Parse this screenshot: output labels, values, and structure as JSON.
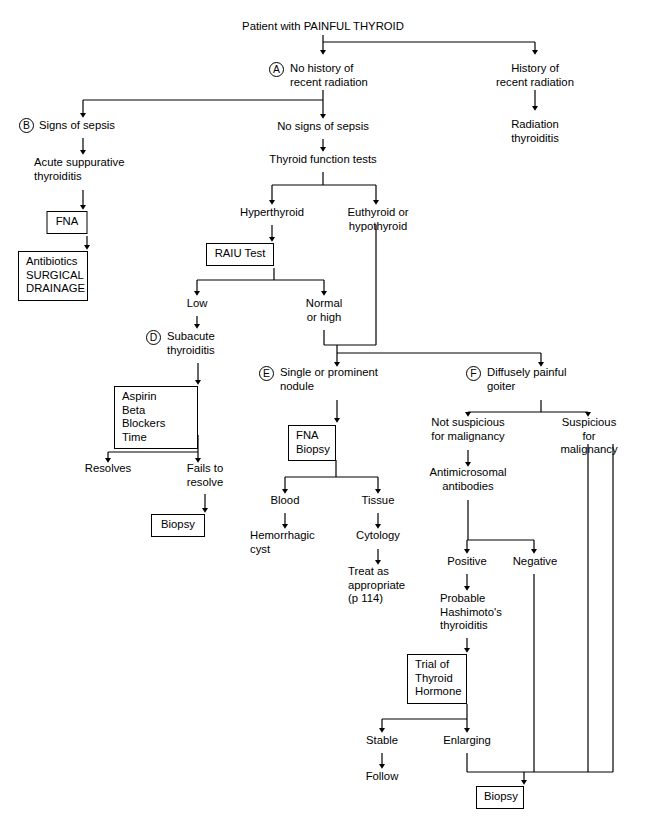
{
  "diagram": {
    "title": "Patient with PAINFUL THYROID",
    "type": "clinical-decision-flowchart"
  },
  "tags": [
    {
      "letter": "A",
      "x": 269,
      "y": 62
    },
    {
      "letter": "B",
      "x": 19,
      "y": 125
    },
    {
      "letter": "C",
      "x": 222,
      "y": 249
    },
    {
      "letter": "D",
      "x": 146,
      "y": 336
    },
    {
      "letter": "E",
      "x": 259,
      "y": 372
    },
    {
      "letter": "F",
      "x": 466,
      "y": 372
    }
  ],
  "nodes": [
    {
      "id": "root",
      "text": "Patient with PAINFUL THYROID",
      "x": 323,
      "y": 22,
      "box": false
    },
    {
      "id": "no-hx-rad",
      "text": "No history of\nrecent radiation",
      "x": 328,
      "y": 62,
      "box": false
    },
    {
      "id": "hx-rad",
      "text": "History of\nrecent radiation",
      "x": 535,
      "y": 62,
      "box": false
    },
    {
      "id": "rad-thyroiditis",
      "text": "Radiation\nthyroiditis",
      "x": 535,
      "y": 118,
      "box": false
    },
    {
      "id": "signs-sepsis",
      "text": "Signs of sepsis",
      "x": 83,
      "y": 125,
      "box": false
    },
    {
      "id": "acute-supp",
      "text": "Acute suppurative\nthyroiditis",
      "x": 83,
      "y": 162,
      "box": false
    },
    {
      "id": "fna-1",
      "text": "FNA",
      "x": 87,
      "y": 213,
      "box": true,
      "w": 41,
      "h": 23
    },
    {
      "id": "abx-surg",
      "text": "Antibiotics\nSURGICAL\nDRAINAGE",
      "x": 87,
      "y": 253,
      "box": true,
      "w": 70,
      "h": 48
    },
    {
      "id": "no-signs-sepsis",
      "text": "No signs of sepsis",
      "x": 323,
      "y": 126,
      "box": false
    },
    {
      "id": "tft",
      "text": "Thyroid function tests",
      "x": 323,
      "y": 159,
      "box": false
    },
    {
      "id": "hyperthyroid",
      "text": "Hyperthyroid",
      "x": 272,
      "y": 212,
      "box": false
    },
    {
      "id": "eu-hypo",
      "text": "Euthyroid or\nhypothyroid",
      "x": 376,
      "y": 212,
      "box": false
    },
    {
      "id": "raiu",
      "text": "RAIU Test",
      "x": 274,
      "y": 245,
      "box": true,
      "w": 68,
      "h": 23
    },
    {
      "id": "low",
      "text": "Low",
      "x": 197,
      "y": 303,
      "box": false
    },
    {
      "id": "normal-high",
      "text": "Normal\nor high",
      "x": 324,
      "y": 303,
      "box": false
    },
    {
      "id": "subacute",
      "text": "Subacute\nthyroiditis",
      "x": 197,
      "y": 336,
      "box": false
    },
    {
      "id": "aspirin",
      "text": "Aspirin\nBeta Blockers\nTime",
      "x": 156,
      "y": 388,
      "box": true,
      "w": 84,
      "h": 47
    },
    {
      "id": "resolves",
      "text": "Resolves",
      "x": 108,
      "y": 468,
      "box": false
    },
    {
      "id": "fails-resolve",
      "text": "Fails to\nresolve",
      "x": 198,
      "y": 468,
      "box": false
    },
    {
      "id": "biopsy-1",
      "text": "Biopsy",
      "x": 178,
      "y": 516,
      "box": true,
      "w": 54,
      "h": 23
    },
    {
      "id": "single-nodule",
      "text": "Single or prominent\nnodule",
      "x": 337,
      "y": 372,
      "box": false
    },
    {
      "id": "fna-biopsy",
      "text": "FNA\nBiopsy",
      "x": 312,
      "y": 427,
      "box": true,
      "w": 48,
      "h": 33
    },
    {
      "id": "blood",
      "text": "Blood",
      "x": 285,
      "y": 500,
      "box": false
    },
    {
      "id": "tissue",
      "text": "Tissue",
      "x": 378,
      "y": 500,
      "box": false
    },
    {
      "id": "hem-cyst",
      "text": "Hemorrhagic\ncyst",
      "x": 285,
      "y": 535,
      "box": false
    },
    {
      "id": "cytology",
      "text": "Cytology",
      "x": 378,
      "y": 535,
      "box": false
    },
    {
      "id": "treat-approp",
      "text": "Treat as\nappropriate\n(p 114)",
      "x": 378,
      "y": 570,
      "box": false
    },
    {
      "id": "diffuse-goiter",
      "text": "Diffusely painful\ngoiter",
      "x": 541,
      "y": 372,
      "box": false
    },
    {
      "id": "not-susp",
      "text": "Not suspicious\nfor malignancy",
      "x": 468,
      "y": 422,
      "box": false
    },
    {
      "id": "susp",
      "text": "Suspicious for\nmalignancy",
      "x": 588,
      "y": 422,
      "box": false
    },
    {
      "id": "antimicrosomal",
      "text": "Antimicrosomal\nantibodies",
      "x": 468,
      "y": 472,
      "box": false
    },
    {
      "id": "positive",
      "text": "Positive",
      "x": 467,
      "y": 561,
      "box": false
    },
    {
      "id": "negative",
      "text": "Negative",
      "x": 534,
      "y": 561,
      "box": false
    },
    {
      "id": "hashimotos",
      "text": "Probable\nHashimoto's\nthyroiditis",
      "x": 467,
      "y": 598,
      "box": false
    },
    {
      "id": "trial-hormone",
      "text": "Trial of\nThyroid\nHormone",
      "x": 437,
      "y": 656,
      "box": true,
      "w": 60,
      "h": 48
    },
    {
      "id": "stable",
      "text": "Stable",
      "x": 382,
      "y": 740,
      "box": false
    },
    {
      "id": "enlarging",
      "text": "Enlarging",
      "x": 467,
      "y": 740,
      "box": false
    },
    {
      "id": "follow",
      "text": "Follow",
      "x": 382,
      "y": 776,
      "box": false
    },
    {
      "id": "biopsy-2",
      "text": "Biopsy",
      "x": 500,
      "y": 788,
      "box": true,
      "w": 48,
      "h": 23
    }
  ],
  "colors": {
    "stroke": "#000000",
    "background": "#ffffff",
    "text": "#000000"
  },
  "edges": [
    "root -> no-history-of-recent-radiation",
    "root -> history-of-recent-radiation",
    "history-of-recent-radiation -> radiation-thyroiditis",
    "no-history -> signs-of-sepsis",
    "no-history -> no-signs-of-sepsis",
    "signs-of-sepsis -> acute-suppurative-thyroiditis -> FNA -> antibiotics-surgical-drainage",
    "no-signs-of-sepsis -> thyroid-function-tests",
    "thyroid-function-tests -> hyperthyroid",
    "thyroid-function-tests -> euthyroid-or-hypothyroid",
    "hyperthyroid -> RAIU-test",
    "RAIU-test -> low",
    "RAIU-test -> normal-or-high",
    "low -> subacute-thyroiditis -> aspirin-beta-blockers-time",
    "aspirin -> resolves",
    "aspirin -> fails-to-resolve -> biopsy",
    "normal-or-high + euthyroid-or-hypothyroid -> single-or-prominent-nodule",
    "normal-or-high + euthyroid-or-hypothyroid -> diffusely-painful-goiter",
    "single-or-prominent-nodule -> FNA-biopsy",
    "FNA-biopsy -> blood -> hemorrhagic-cyst",
    "FNA-biopsy -> tissue -> cytology -> treat-as-appropriate",
    "diffusely-painful-goiter -> not-suspicious-for-malignancy",
    "diffusely-painful-goiter -> suspicious-for-malignancy",
    "not-suspicious -> antimicrosomal-antibodies",
    "antimicrosomal-antibodies -> positive",
    "antimicrosomal-antibodies -> negative",
    "positive -> probable-hashimotos-thyroiditis -> trial-of-thyroid-hormone",
    "trial-of-thyroid-hormone -> stable -> follow",
    "trial-of-thyroid-hormone -> enlarging -> biopsy",
    "negative -> biopsy",
    "suspicious-for-malignancy -> biopsy"
  ]
}
